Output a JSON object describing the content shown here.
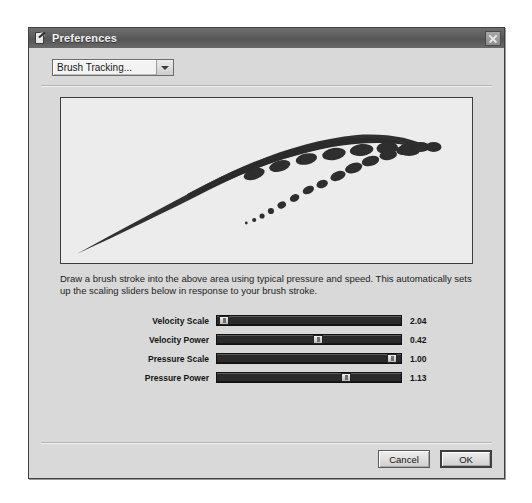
{
  "window": {
    "title": "Preferences",
    "icon": "preferences-pen-icon",
    "close_label": "×"
  },
  "category_select": {
    "selected": "Brush Tracking...",
    "options": [
      "Brush Tracking..."
    ],
    "arrow_icon": "chevron-down-icon"
  },
  "canvas": {
    "name": "brush-stroke-preview",
    "background": "#ececec",
    "stroke_color": "#303030"
  },
  "description": "Draw a brush stroke into the above area using typical pressure and speed.  This automatically sets up the scaling sliders below in response to your brush stroke.",
  "sliders": [
    {
      "label": "Velocity Scale",
      "value": "2.04",
      "percent": 4
    },
    {
      "label": "Velocity Power",
      "value": "0.42",
      "percent": 55
    },
    {
      "label": "Pressure Scale",
      "value": "1.00",
      "percent": 95
    },
    {
      "label": "Pressure Power",
      "value": "1.13",
      "percent": 70
    }
  ],
  "footer": {
    "cancel_label": "Cancel",
    "ok_label": "OK"
  },
  "colors": {
    "titlebar": "#5c5c5c",
    "dialog_face": "#d9d9d9",
    "slider_track": "#2b2b2b",
    "text": "#1a1a1a"
  }
}
